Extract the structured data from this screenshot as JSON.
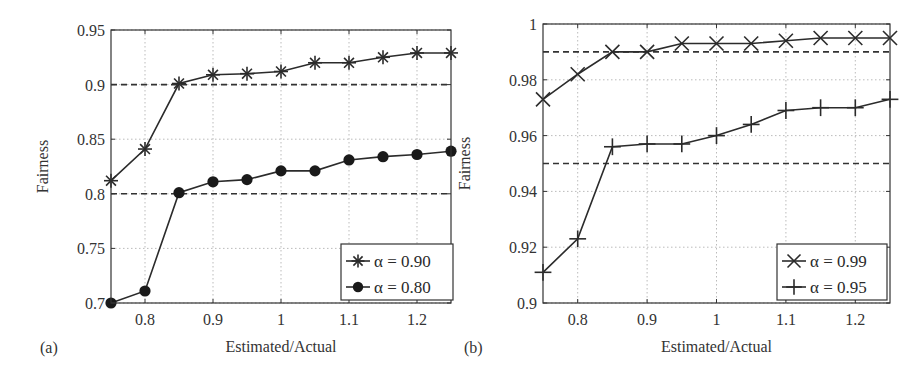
{
  "chart_data": [
    {
      "panel_label": "(a)",
      "type": "line",
      "xlabel": "Estimated/Actual",
      "ylabel": "Fairness",
      "xlim": [
        0.75,
        1.25
      ],
      "ylim": [
        0.7,
        0.95
      ],
      "xticks": [
        0.8,
        0.9,
        1,
        1.1,
        1.2
      ],
      "xtick_labels": [
        "0.8",
        "0.9",
        "1",
        "1.1",
        "1.2"
      ],
      "yticks": [
        0.7,
        0.75,
        0.8,
        0.85,
        0.9,
        0.95
      ],
      "ytick_labels": [
        "0.7",
        "0.75",
        "0.8",
        "0.85",
        "0.9",
        "0.95"
      ],
      "grid": true,
      "legend_position": "lower right",
      "x": [
        0.75,
        0.8,
        0.85,
        0.9,
        0.95,
        1.0,
        1.05,
        1.1,
        1.15,
        1.2,
        1.25
      ],
      "series": [
        {
          "name": "α = 0.90",
          "marker": "asterisk",
          "values": [
            0.812,
            0.841,
            0.901,
            0.909,
            0.91,
            0.912,
            0.92,
            0.92,
            0.925,
            0.929,
            0.929
          ]
        },
        {
          "name": "α = 0.80",
          "marker": "filled-circle",
          "values": [
            0.7,
            0.711,
            0.801,
            0.811,
            0.813,
            0.821,
            0.821,
            0.831,
            0.834,
            0.836,
            0.839
          ]
        }
      ],
      "reference_lines": [
        {
          "y": 0.9,
          "style": "dashed"
        },
        {
          "y": 0.8,
          "style": "dashed"
        }
      ]
    },
    {
      "panel_label": "(b)",
      "type": "line",
      "xlabel": "Estimated/Actual",
      "ylabel": "Fairness",
      "xlim": [
        0.75,
        1.25
      ],
      "ylim": [
        0.9,
        1.0
      ],
      "xticks": [
        0.8,
        0.9,
        1,
        1.1,
        1.2
      ],
      "xtick_labels": [
        "0.8",
        "0.9",
        "1",
        "1.1",
        "1.2"
      ],
      "yticks": [
        0.9,
        0.92,
        0.94,
        0.96,
        0.98,
        1.0
      ],
      "ytick_labels": [
        "0.9",
        "0.92",
        "0.94",
        "0.96",
        "0.98",
        "1"
      ],
      "grid": true,
      "legend_position": "lower right",
      "x": [
        0.75,
        0.8,
        0.85,
        0.9,
        0.95,
        1.0,
        1.05,
        1.1,
        1.15,
        1.2,
        1.25
      ],
      "series": [
        {
          "name": "α = 0.99",
          "marker": "x",
          "values": [
            0.973,
            0.982,
            0.99,
            0.99,
            0.993,
            0.993,
            0.993,
            0.994,
            0.995,
            0.995,
            0.995
          ]
        },
        {
          "name": "α = 0.95",
          "marker": "plus",
          "values": [
            0.911,
            0.923,
            0.956,
            0.957,
            0.957,
            0.96,
            0.964,
            0.969,
            0.97,
            0.97,
            0.973
          ]
        }
      ],
      "reference_lines": [
        {
          "y": 0.99,
          "style": "dashed"
        },
        {
          "y": 0.95,
          "style": "dashed"
        }
      ]
    }
  ],
  "panels": [
    {
      "label": "(a)",
      "xlabel": "Estimated/Actual",
      "ylabel": "Fairness",
      "legend": [
        "α = 0.90",
        "α = 0.80"
      ]
    },
    {
      "label": "(b)",
      "xlabel": "Estimated/Actual",
      "ylabel": "Fairness",
      "legend": [
        "α = 0.99",
        "α = 0.95"
      ]
    }
  ]
}
